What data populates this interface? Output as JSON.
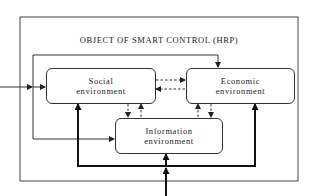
{
  "diagram": {
    "title": "OBJECT OF SMART CONTROL (HRP)",
    "nodes": [
      {
        "id": "social",
        "line1": "Social",
        "line2": "environment"
      },
      {
        "id": "economic",
        "line1": "Economic",
        "line2": "environment"
      },
      {
        "id": "information",
        "line1": "Information",
        "line2": "environment"
      }
    ],
    "edges": [
      {
        "from": "external-left-input",
        "to": "social",
        "style": "solid"
      },
      {
        "from": "feedback-loop",
        "to": "economic",
        "style": "solid"
      },
      {
        "from": "feedback-loop",
        "to": "information",
        "style": "solid"
      },
      {
        "from": "social",
        "to": "economic",
        "style": "dashed"
      },
      {
        "from": "economic",
        "to": "social",
        "style": "dashed"
      },
      {
        "from": "social",
        "to": "information",
        "style": "dashed"
      },
      {
        "from": "information",
        "to": "social",
        "style": "dashed"
      },
      {
        "from": "economic",
        "to": "information",
        "style": "dashed"
      },
      {
        "from": "information",
        "to": "economic",
        "style": "dashed"
      },
      {
        "from": "external-bottom-input",
        "to": "information",
        "style": "bold"
      },
      {
        "from": "external-bottom-input",
        "to": "social",
        "style": "bold"
      },
      {
        "from": "external-bottom-input",
        "to": "economic",
        "style": "bold"
      }
    ]
  }
}
